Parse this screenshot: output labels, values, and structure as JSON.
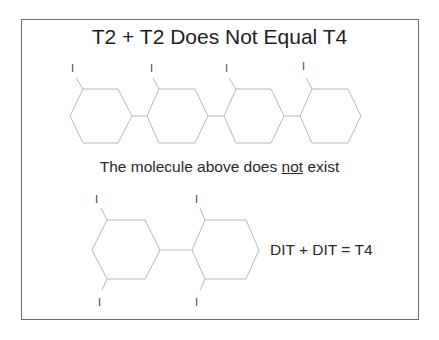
{
  "slide": {
    "title": "T2 + T2 Does Not Equal T4",
    "caption_before": "The molecule above does ",
    "caption_emphasis": "not",
    "caption_after": " exist",
    "equation": "DIT + DIT = T4"
  },
  "top_molecule": {
    "rings": 4,
    "substituent_label": "I",
    "substituents": [
      "I",
      "I",
      "I",
      "I"
    ]
  },
  "bottom_molecule": {
    "rings": 2,
    "substituent_label": "I",
    "substituents": [
      "I",
      "I",
      "I",
      "I"
    ]
  },
  "colors": {
    "frame": "#6e6e6e",
    "bonds": "#b8b8b8",
    "text": "#2a2a2a"
  }
}
